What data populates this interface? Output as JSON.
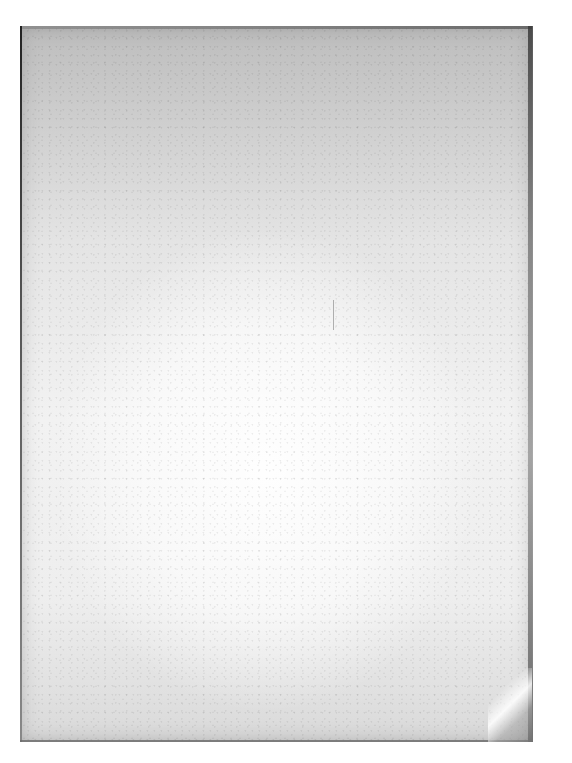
{
  "document": {
    "type": "scanned-page",
    "description": "Blank aged paper page",
    "text_content": "",
    "colors": {
      "background": "#ffffff",
      "paper_light": "#f2f2f2",
      "paper_dark": "#bdbdbd",
      "edge": "#333333"
    }
  }
}
